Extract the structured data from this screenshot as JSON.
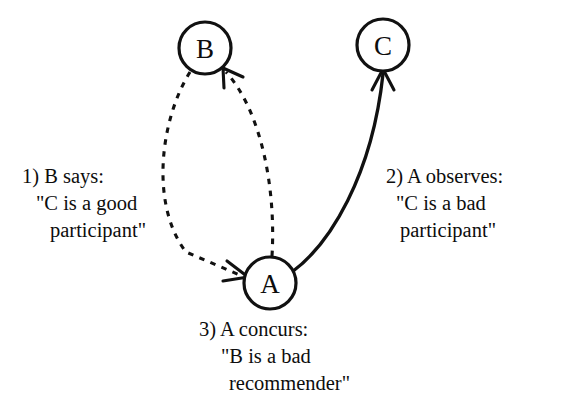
{
  "diagram": {
    "background_color": "#ffffff",
    "stroke_color": "#111111",
    "nodes": [
      {
        "id": "B",
        "label": "B",
        "cx": 205,
        "cy": 48,
        "r": 26
      },
      {
        "id": "C",
        "label": "C",
        "cx": 383,
        "cy": 45,
        "r": 26
      },
      {
        "id": "A",
        "label": "A",
        "cx": 270,
        "cy": 283,
        "r": 26
      }
    ],
    "edges": [
      {
        "id": "b-to-a",
        "from": "B",
        "to": "A",
        "style": "dashed",
        "arrow_at": "A"
      },
      {
        "id": "a-to-b",
        "from": "A",
        "to": "B",
        "style": "dashed",
        "arrow_at": "B"
      },
      {
        "id": "a-to-c",
        "from": "A",
        "to": "C",
        "style": "solid",
        "arrow_at": "C"
      }
    ],
    "captions": {
      "left": {
        "line1": "1) B says:",
        "line2": "\"C is a good",
        "line3": "participant\""
      },
      "right": {
        "line1": "2) A observes:",
        "line2": "\"C is a bad",
        "line3": "participant\""
      },
      "bottom": {
        "line1": "3) A concurs:",
        "line2": "\"B is a bad",
        "line3": "recommender\""
      }
    }
  }
}
